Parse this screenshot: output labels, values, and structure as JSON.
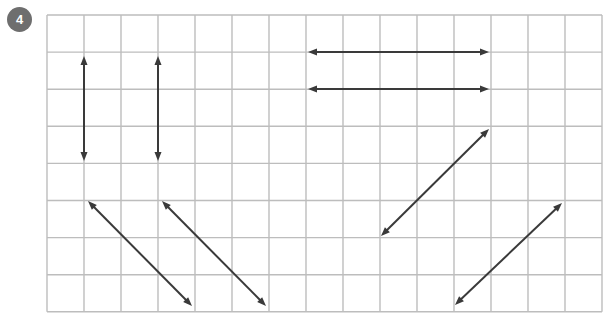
{
  "badge": {
    "label": "4",
    "bg_color": "#6e6e6e",
    "text_color": "#ffffff"
  },
  "worksheet": {
    "title": "",
    "background_color": "#ffffff"
  },
  "grid": {
    "x": 47,
    "y": 15,
    "columns": 15,
    "rows": 8,
    "cell_width": 37,
    "cell_height": 37.1,
    "line_color": "#bdbdbd",
    "line_width": 1.4,
    "border_color": "#c9c9c9"
  },
  "arrows": {
    "color": "#3a3a3a",
    "stroke_width": 2,
    "head_length": 9,
    "head_width": 7,
    "items": [
      {
        "name": "vertical-arrow-left",
        "orientation": "vertical",
        "double_headed": true,
        "x1": 84,
        "y1": 56,
        "x2": 84,
        "y2": 161
      },
      {
        "name": "vertical-arrow-second",
        "orientation": "vertical",
        "double_headed": true,
        "x1": 158,
        "y1": 56,
        "x2": 158,
        "y2": 161
      },
      {
        "name": "horizontal-arrow-top",
        "orientation": "horizontal",
        "double_headed": true,
        "x1": 308,
        "y1": 52,
        "x2": 489,
        "y2": 52
      },
      {
        "name": "horizontal-arrow-bottom",
        "orientation": "horizontal",
        "double_headed": true,
        "x1": 308,
        "y1": 89,
        "x2": 489,
        "y2": 89
      },
      {
        "name": "diagonal-arrow-up-right-middle",
        "orientation": "diagonal-up-right",
        "double_headed": true,
        "x1": 381,
        "y1": 236,
        "x2": 489,
        "y2": 129
      },
      {
        "name": "diagonal-arrow-down-right-first",
        "orientation": "diagonal-down-right",
        "double_headed": true,
        "x1": 88,
        "y1": 201,
        "x2": 192,
        "y2": 306
      },
      {
        "name": "diagonal-arrow-down-right-second",
        "orientation": "diagonal-down-right",
        "double_headed": true,
        "x1": 162,
        "y1": 201,
        "x2": 266,
        "y2": 306
      },
      {
        "name": "diagonal-arrow-up-right-right",
        "orientation": "diagonal-up-right",
        "double_headed": true,
        "x1": 455,
        "y1": 305,
        "x2": 562,
        "y2": 203
      }
    ]
  }
}
